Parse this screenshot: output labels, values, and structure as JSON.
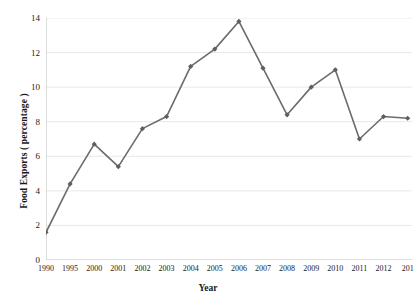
{
  "chart_data": {
    "type": "line",
    "title": "",
    "xlabel": "Year",
    "ylabel": "Food Exports ( percentage )",
    "categories": [
      "1990",
      "1995",
      "2000",
      "2001",
      "2002",
      "2003",
      "2004",
      "2005",
      "2006",
      "2007",
      "2008",
      "2009",
      "2010",
      "2011",
      "2012",
      "2013"
    ],
    "values": [
      1.6,
      4.4,
      6.7,
      5.4,
      7.6,
      8.3,
      11.2,
      12.2,
      13.8,
      11.1,
      8.4,
      10.0,
      11.0,
      7.0,
      8.3,
      8.2
    ],
    "series": [
      {
        "name": "Food Exports",
        "values": [
          1.6,
          4.4,
          6.7,
          5.4,
          7.6,
          8.3,
          11.2,
          12.2,
          13.8,
          11.1,
          8.4,
          10.0,
          11.0,
          7.0,
          8.3,
          8.2
        ]
      }
    ],
    "ylim": [
      0,
      14
    ],
    "yticks": [
      0,
      2,
      4,
      6,
      8,
      10,
      12,
      14
    ],
    "ytick_labels": [
      "0",
      "2",
      "4",
      "6",
      "8",
      "10",
      "12",
      "14"
    ],
    "xtick_labels": [
      "1990",
      "1995",
      "2000",
      "2001",
      "2002",
      "2003",
      "2004",
      "2005",
      "2006",
      "2007",
      "2008",
      "2009",
      "2010",
      "2011",
      "2012",
      "201"
    ],
    "grid": "horizontal",
    "legend": "none",
    "marker": "diamond",
    "line_color": "#6b6b6b",
    "marker_color": "#5f5f5f",
    "grid_color": "#e8e8e8",
    "axis_color": "#bdbdbd",
    "background": "#ffffff",
    "last_label_truncated": true
  }
}
